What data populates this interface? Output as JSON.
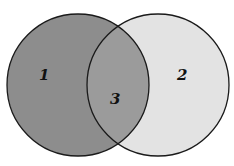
{
  "diagram": {
    "type": "venn",
    "circles": [
      {
        "id": "left",
        "cx": 78,
        "cy": 85,
        "r": 71,
        "fill": "#8d8d8d"
      },
      {
        "id": "right",
        "cx": 158,
        "cy": 85,
        "r": 71,
        "fill": "#e3e3e3"
      }
    ],
    "overlap_fill": "#9b9b9b",
    "stroke": "#1a1a1a",
    "regions": [
      {
        "label": "1",
        "x": 44,
        "y": 80
      },
      {
        "label": "2",
        "x": 181,
        "y": 80
      },
      {
        "label": "3",
        "x": 115,
        "y": 103
      }
    ]
  }
}
